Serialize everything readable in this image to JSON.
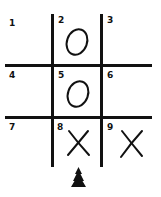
{
  "game": {
    "type": "tic-tac-toe",
    "cells": [
      {
        "index": 1,
        "label": "1",
        "mark": ""
      },
      {
        "index": 2,
        "label": "2",
        "mark": "O"
      },
      {
        "index": 3,
        "label": "3",
        "mark": ""
      },
      {
        "index": 4,
        "label": "4",
        "mark": ""
      },
      {
        "index": 5,
        "label": "5",
        "mark": "O"
      },
      {
        "index": 6,
        "label": "6",
        "mark": ""
      },
      {
        "index": 7,
        "label": "7",
        "mark": ""
      },
      {
        "index": 8,
        "label": "8",
        "mark": "X"
      },
      {
        "index": 9,
        "label": "9",
        "mark": "X"
      }
    ],
    "pointer": {
      "cell": 8,
      "icon": "pawn-arrow-icon"
    }
  },
  "colors": {
    "ink": "#111111",
    "background": "#ffffff"
  }
}
